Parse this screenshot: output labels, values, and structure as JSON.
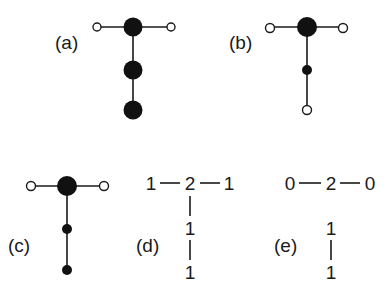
{
  "figure": {
    "panels": [
      {
        "id": "a",
        "label": "(a)"
      },
      {
        "id": "b",
        "label": "(b)"
      },
      {
        "id": "c",
        "label": "(c)"
      },
      {
        "id": "d",
        "label": "(d)",
        "top_row": [
          "1",
          "2",
          "1"
        ],
        "column": [
          "1",
          "1"
        ]
      },
      {
        "id": "e",
        "label": "(e)",
        "top_row": [
          "0",
          "2",
          "0"
        ],
        "column": [
          "1",
          "1"
        ]
      }
    ]
  }
}
